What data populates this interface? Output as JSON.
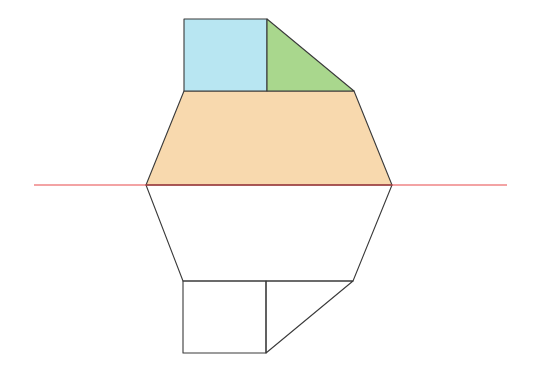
{
  "diagram": {
    "colors": {
      "square_fill": "#b8e6f2",
      "triangle_fill": "#a9d78d",
      "trapezoid_fill": "#f8d9ae",
      "outline": "#3a3a3a",
      "mirror_line": "#e8484a",
      "background": "#ffffff"
    },
    "mirror_line": {
      "x1": 34,
      "y1": 185,
      "x2": 507,
      "y2": 185
    },
    "original": {
      "square": [
        [
          184,
          19
        ],
        [
          267,
          19
        ],
        [
          267,
          91
        ],
        [
          184,
          91
        ]
      ],
      "triangle": [
        [
          267,
          19
        ],
        [
          354,
          91
        ],
        [
          267,
          91
        ]
      ],
      "trapezoid": [
        [
          184,
          91
        ],
        [
          354,
          91
        ],
        [
          392,
          185
        ],
        [
          146,
          185
        ]
      ]
    },
    "reflection": {
      "trapezoid": [
        [
          146,
          185
        ],
        [
          392,
          185
        ],
        [
          353,
          281
        ],
        [
          183,
          281
        ]
      ],
      "square": [
        [
          183,
          281
        ],
        [
          266,
          281
        ],
        [
          266,
          353
        ],
        [
          183,
          353
        ]
      ],
      "triangle": [
        [
          266,
          281
        ],
        [
          353,
          281
        ],
        [
          266,
          353
        ]
      ]
    }
  }
}
